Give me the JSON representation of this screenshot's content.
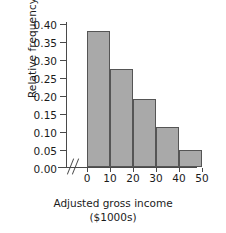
{
  "chart_data": {
    "type": "bar",
    "title": "",
    "subtitle": "",
    "xlabel": "Adjusted gross income",
    "xlabel_units": "($1000s)",
    "ylabel": "Relative frequency",
    "categories": [
      "0-10",
      "10-20",
      "20-30",
      "30-40",
      "40-50"
    ],
    "bin_edges": [
      0,
      10,
      20,
      30,
      40,
      50
    ],
    "values": [
      0.38,
      0.275,
      0.19,
      0.112,
      0.048
    ],
    "xlim": [
      0,
      50
    ],
    "ylim": [
      0.0,
      0.4
    ],
    "x_ticks": [
      0,
      10,
      20,
      30,
      40,
      50
    ],
    "x_tick_labels": [
      "0",
      "10",
      "20",
      "30",
      "40",
      "50"
    ],
    "y_ticks": [
      0.0,
      0.05,
      0.1,
      0.15,
      0.2,
      0.25,
      0.3,
      0.35,
      0.4
    ],
    "y_tick_labels": [
      "0.00",
      "0.05",
      "0.10",
      "0.15",
      "0.20",
      "0.25",
      "0.30",
      "0.35",
      "0.40"
    ],
    "grid": false,
    "legend": null,
    "axis_break": "//",
    "bar_fill_color": "#a9a9a9",
    "bar_edge_color": "#555555",
    "axis_color": "#4a4a4a",
    "text_color": "#1b1b1b",
    "background_color": "#ffffff"
  }
}
